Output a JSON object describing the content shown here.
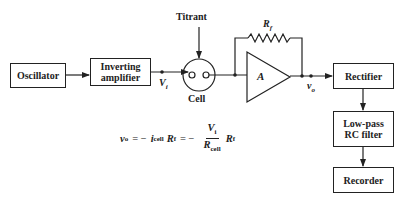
{
  "diagram": {
    "blocks": {
      "oscillator": "Oscillator",
      "inverting_amplifier_line1": "Inverting",
      "inverting_amplifier_line2": "amplifier",
      "rectifier": "Rectifier",
      "lowpass_line1": "Low-pass",
      "lowpass_line2": "RC filter",
      "recorder": "Recorder"
    },
    "labels": {
      "titrant": "Titrant",
      "cell": "Cell",
      "vi_main": "V",
      "vi_sub": "i",
      "amp": "A",
      "rf_main": "R",
      "rf_sub": "f",
      "vo_main": "v",
      "vo_sub": "o"
    },
    "equation": {
      "lhs_main": "v",
      "lhs_sub": "o",
      "eq1": "= −",
      "i_main": "i",
      "i_sub": "cell",
      "r1_main": "R",
      "r1_sub": "f",
      "eq2": "= −",
      "num_main": "V",
      "num_sub": "i",
      "den_main": "R",
      "den_sub": "cell",
      "r2_main": "R",
      "r2_sub": "f"
    },
    "connections": [
      "Oscillator → Inverting amplifier",
      "Inverting amplifier → Cell (V_i)",
      "Titrant → Cell",
      "Cell → Amplifier A with feedback R_f",
      "Amplifier A → Rectifier (v_o)",
      "Rectifier → Low-pass RC filter",
      "Low-pass RC filter → Recorder"
    ],
    "colors": {
      "line": "#222222",
      "background": "#ffffff"
    }
  }
}
